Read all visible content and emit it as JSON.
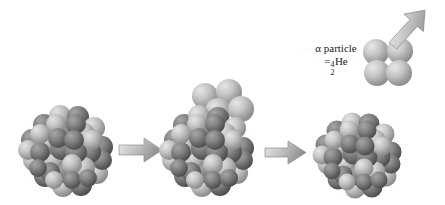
{
  "figure": {
    "title": "",
    "background_color": "#ffffff",
    "caption": ""
  },
  "colors": {
    "sphere_light": "#c9c9c9",
    "sphere_light_shadow": "#8f8f8f",
    "sphere_dark": "#888888",
    "sphere_dark_shadow": "#555555",
    "arrow_fill_light": "#e2e2e2",
    "arrow_fill_dark": "#9a9a9a",
    "arrow_outline": "#8a8a8a",
    "text": "#1a1a1a",
    "shadow": "#d8d8d8"
  },
  "alpha_label": {
    "line1": "α particle",
    "line2_equals": "=",
    "mass_number": "4",
    "atomic_number": "2",
    "element": "He"
  },
  "stages": [
    {
      "name": "parent-nucleus",
      "label": "",
      "cx": 66,
      "cy": 150,
      "radius": 44,
      "sphere_count": 48,
      "has_budding_alpha": false
    },
    {
      "name": "nucleus-with-budding-alpha",
      "label": "",
      "cx": 209,
      "cy": 150,
      "radius": 44,
      "sphere_count": 48,
      "has_budding_alpha": true
    },
    {
      "name": "daughter-nucleus",
      "label": "",
      "cx": 355,
      "cy": 152,
      "radius": 41,
      "sphere_count": 44,
      "has_budding_alpha": false
    }
  ],
  "emitted_alpha": {
    "name": "emitted-alpha-particle",
    "cx": 388,
    "cy": 62,
    "nucleon_count": 4,
    "nucleon_radius": 13
  },
  "arrows": [
    {
      "name": "process-arrow-1",
      "x": 118,
      "y": 136,
      "width": 44,
      "height": 26,
      "direction": "right"
    },
    {
      "name": "process-arrow-2",
      "x": 264,
      "y": 140,
      "width": 42,
      "height": 25,
      "direction": "right"
    },
    {
      "name": "emission-arrow",
      "x": 386,
      "y": 4,
      "width": 44,
      "height": 48,
      "direction": "up-right"
    }
  ]
}
